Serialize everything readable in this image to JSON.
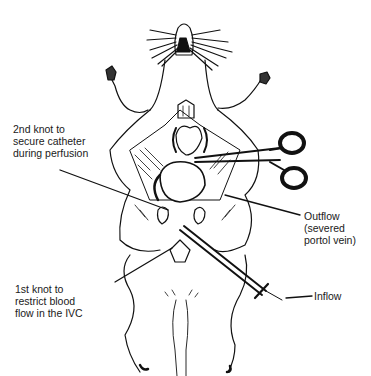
{
  "figure": {
    "colors": {
      "ink": "#111111",
      "background": "#ffffff"
    }
  },
  "labels": {
    "second_knot": [
      "2nd knot to",
      "secure catheter",
      "during perfusion"
    ],
    "outflow": [
      "Outflow",
      "(severed",
      "portol vein)"
    ],
    "first_knot": [
      "1st knot to",
      "restrict blood",
      "flow in the IVC"
    ],
    "inflow": [
      "Inflow"
    ]
  }
}
